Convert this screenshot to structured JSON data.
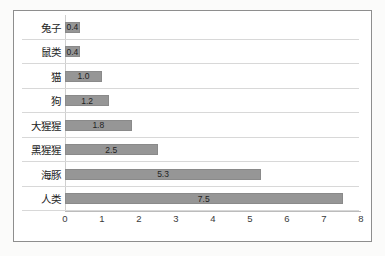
{
  "chart_data": {
    "type": "bar",
    "orientation": "horizontal",
    "title": "",
    "xlabel": "",
    "ylabel": "",
    "grid": true,
    "legend": false,
    "xlim": [
      0,
      8
    ],
    "xticks": [
      0,
      1,
      2,
      3,
      4,
      5,
      6,
      7,
      8
    ],
    "xtick_labels": [
      "0",
      "1",
      "2",
      "3",
      "4",
      "5",
      "6",
      "7",
      "8"
    ],
    "categories": [
      "兔子",
      "鼠类",
      "猫",
      "狗",
      "大猩猩",
      "黑猩猩",
      "海豚",
      "人类"
    ],
    "values": [
      0.4,
      0.4,
      1.0,
      1.2,
      1.8,
      2.5,
      5.3,
      7.5
    ],
    "value_labels": [
      "0.4",
      "0.4",
      "1.0",
      "1.2",
      "1.8",
      "2.5",
      "5.3",
      "7.5"
    ],
    "bars": [
      {
        "category": "兔子",
        "value": 0.4,
        "label": "0.4"
      },
      {
        "category": "鼠类",
        "value": 0.4,
        "label": "0.4"
      },
      {
        "category": "猫",
        "value": 1.0,
        "label": "1.0"
      },
      {
        "category": "狗",
        "value": 1.2,
        "label": "1.2"
      },
      {
        "category": "大猩猩",
        "value": 1.8,
        "label": "1.8"
      },
      {
        "category": "黑猩猩",
        "value": 2.5,
        "label": "2.5"
      },
      {
        "category": "海豚",
        "value": 5.3,
        "label": "5.3"
      },
      {
        "category": "人类",
        "value": 7.5,
        "label": "7.5"
      }
    ],
    "colors": {
      "bar_fill": "#969696",
      "bar_border": "#8a8a8a",
      "gridline": "#d8d8d8",
      "axis": "#bcbcbc",
      "frame_border": "#8e8e8e",
      "plot_background": "#ffffff",
      "page_background": "#fbfbfa",
      "label_text": "#1c1c1c",
      "tick_text": "#3a3a3a"
    }
  }
}
